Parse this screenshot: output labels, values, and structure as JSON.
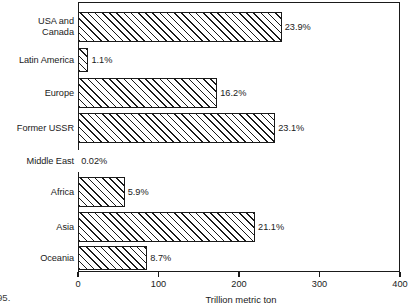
{
  "chart_data": {
    "type": "bar",
    "orientation": "horizontal",
    "title": "",
    "xlabel": "Trillion metric ton",
    "ylabel": "",
    "xlim": [
      0,
      400
    ],
    "xticks": [
      0,
      100,
      200,
      300,
      400
    ],
    "xtick_labels": [
      "0",
      "100",
      "200",
      "300",
      "400"
    ],
    "grid": false,
    "legend": false,
    "categories": [
      "USA and\nCanada",
      "Latin America",
      "Europe",
      "Former USSR",
      "Middle East",
      "Africa",
      "Asia",
      "Oceania"
    ],
    "values": [
      253,
      13,
      173,
      245,
      0.2,
      58,
      220,
      86
    ],
    "data_labels": [
      "23.9%",
      "1.1%",
      "16.2%",
      "23.1%",
      "0.02%",
      "5.9%",
      "21.1%",
      "8.7%"
    ],
    "bar_style": {
      "fill": "#ffffff",
      "edge": "#1a1a1a",
      "hatch": "forward-diagonal"
    }
  },
  "axis": {
    "x_title": "Trillion metric ton",
    "ticks": [
      {
        "label": "0",
        "value": 0
      },
      {
        "label": "100",
        "value": 100
      },
      {
        "label": "200",
        "value": 200
      },
      {
        "label": "300",
        "value": 300
      },
      {
        "label": "400",
        "value": 400
      }
    ]
  },
  "rows": [
    {
      "label": "USA and\nCanada",
      "value_label": "23.9%",
      "value": 253,
      "top": 12,
      "height": 30
    },
    {
      "label": "Latin America",
      "value_label": "1.1%",
      "value": 13,
      "top": 48,
      "height": 24
    },
    {
      "label": "Europe",
      "value_label": "16.2%",
      "value": 173,
      "top": 78,
      "height": 30
    },
    {
      "label": "Former USSR",
      "value_label": "23.1%",
      "value": 245,
      "top": 113,
      "height": 30
    },
    {
      "label": "Middle East",
      "value_label": "0.02%",
      "value": 0.2,
      "top": 150,
      "height": 22
    },
    {
      "label": "Africa",
      "value_label": "5.9%",
      "value": 58,
      "top": 177,
      "height": 30
    },
    {
      "label": "Asia",
      "value_label": "21.1%",
      "value": 220,
      "top": 212,
      "height": 30
    },
    {
      "label": "Oceania",
      "value_label": "8.7%",
      "value": 86,
      "top": 246,
      "height": 24
    }
  ],
  "page_artifact": "95.",
  "colors": {
    "ink": "#1a1a1a",
    "paper": "#ffffff"
  }
}
